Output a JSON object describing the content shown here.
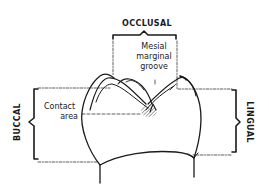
{
  "diagram": {
    "type": "dental-anatomy",
    "line_color": "#1a1a1a",
    "background": "#ffffff",
    "labels": {
      "occlusal": "OCCLUSAL",
      "buccal": "BUCCAL",
      "lingual": "LINGUAL",
      "mesial_marginal_groove_line1": "Mesial",
      "mesial_marginal_groove_line2": "marginal",
      "mesial_marginal_groove_line3": "groove",
      "contact_area_line1": "Contact",
      "contact_area_line2": "area"
    }
  }
}
